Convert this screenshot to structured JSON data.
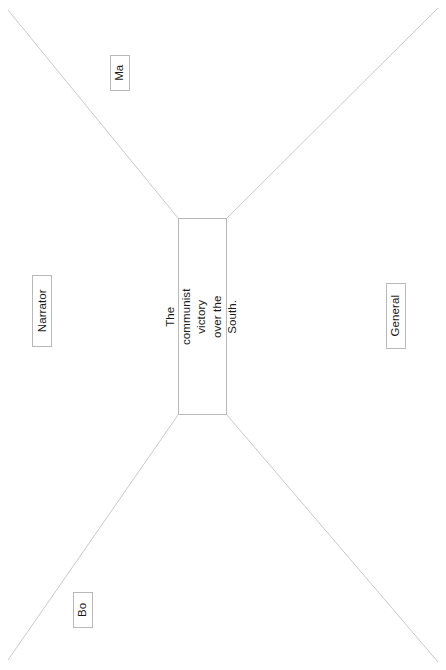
{
  "diagram": {
    "orientation": "rotated-90",
    "line_color": "#c9c9c9",
    "border_color": "#b8b8b8",
    "text_color": "#1a1a1a",
    "background_color": "#ffffff",
    "center": {
      "id": "center-node",
      "text": "The communist victory over the South."
    },
    "nodes": [
      {
        "id": "node-ma",
        "label": "Ma"
      },
      {
        "id": "node-narrator",
        "label": "Narrator"
      },
      {
        "id": "node-general",
        "label": "General"
      },
      {
        "id": "node-bo",
        "label": "Bo"
      }
    ],
    "connectors": [
      {
        "id": "connector-top-left",
        "from": "center-node",
        "to": "node-ma",
        "x1": 178,
        "y1": 218,
        "x2": 8,
        "y2": 10
      },
      {
        "id": "connector-top-right",
        "from": "center-node",
        "to": "node-general",
        "x1": 227,
        "y1": 218,
        "x2": 438,
        "y2": 8
      },
      {
        "id": "connector-bottom-left",
        "from": "center-node",
        "to": "node-bo",
        "x1": 178,
        "y1": 415,
        "x2": 8,
        "y2": 660
      },
      {
        "id": "connector-bottom-right",
        "from": "center-node",
        "to": "node-general",
        "x1": 227,
        "y1": 415,
        "x2": 438,
        "y2": 662
      }
    ]
  }
}
